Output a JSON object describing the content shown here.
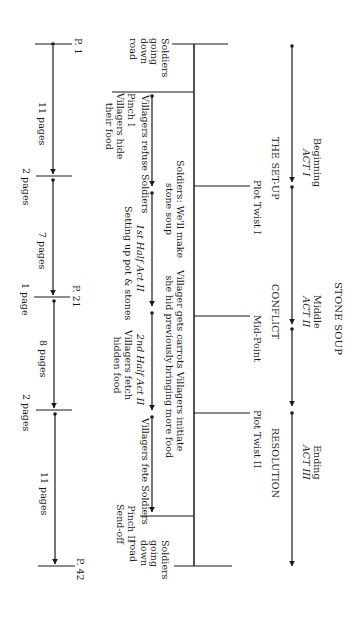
{
  "title": "STONE SOUP",
  "acts": [
    {
      "name": "Beginning",
      "act": "ACT I",
      "phase": "THE SET-UP"
    },
    {
      "name": "Middle",
      "act": "ACT II",
      "phase": "CONFLICT"
    },
    {
      "name": "Ending",
      "act": "ACT III",
      "phase": "RESOLUTION"
    }
  ],
  "plot_points": {
    "twist1": "Plot Twist I",
    "midpoint": "Mid-Point",
    "twist2": "Plot Twist II"
  },
  "story_events": {
    "start": [
      "Soldiers",
      "going",
      "down",
      "road"
    ],
    "twist1": [
      "Soldiers: We'll make",
      "stone soup"
    ],
    "midpoint": [
      "Villager gets carrots",
      "she hid previously"
    ],
    "twist2": [
      "Villagers initiate",
      "bringing more food"
    ],
    "end": [
      "Soldiers",
      "going",
      "down",
      "road"
    ]
  },
  "sub_beats": {
    "pinch1": "Pinch I",
    "hide_food": [
      "Villagers hide",
      "their food"
    ],
    "refuse": "Villagers refuse Soldiers",
    "first_half": "1st Half Act II",
    "setting_up": "Setting up pot & stones",
    "second_half": "2nd Half Act II",
    "fetch": [
      "Villagers fetch",
      "hidden food"
    ],
    "fete": "Villagers fete Soldiers",
    "pinch2": "Pinch II",
    "sendoff": "Send-off"
  },
  "pages": {
    "p1": "P. 1",
    "p21": "P. 21",
    "p42": "P. 42",
    "seg1": "11 pages",
    "seg2": "2 pages",
    "seg3": "7 pages",
    "seg4": "1 page",
    "seg5": "8 pages",
    "seg6": "2 pages",
    "seg7": "11 pages"
  }
}
